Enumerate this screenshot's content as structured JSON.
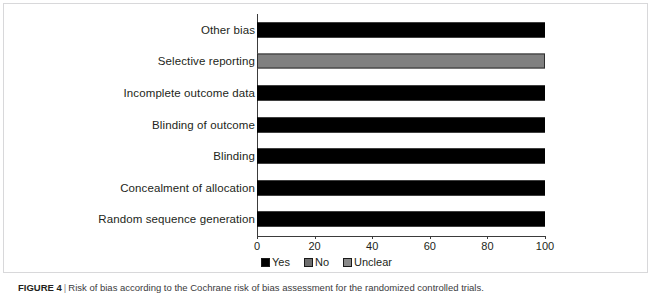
{
  "figure": {
    "caption_label": "FIGURE 4",
    "caption_separator": "|",
    "caption_text": "Risk of bias according to the Cochrane risk of bias assessment for the randomized controlled trials."
  },
  "legend": {
    "items": [
      {
        "label": "Yes",
        "color": "#000000"
      },
      {
        "label": "No",
        "color": "#6e6e6e"
      },
      {
        "label": "Unclear",
        "color": "#8a8a8a"
      }
    ]
  },
  "axis": {
    "x_ticks": [
      "0",
      "20",
      "40",
      "60",
      "80",
      "100"
    ]
  },
  "chart_data": {
    "type": "bar",
    "orientation": "horizontal",
    "stacked": true,
    "title": "",
    "xlabel": "",
    "ylabel": "",
    "xlim": [
      0,
      100
    ],
    "xticks": [
      0,
      20,
      40,
      60,
      80,
      100
    ],
    "grid": false,
    "legend_position": "bottom-center",
    "categories": [
      "Other bias",
      "Selective reporting",
      "Incomplete outcome data",
      "Blinding of outcome",
      "Blinding",
      "Concealment of allocation",
      "Random sequence generation"
    ],
    "series": [
      {
        "name": "Yes",
        "color": "#000000",
        "values": [
          100,
          0,
          100,
          100,
          100,
          100,
          100
        ]
      },
      {
        "name": "No",
        "color": "#6e6e6e",
        "values": [
          0,
          0,
          0,
          0,
          0,
          0,
          0
        ]
      },
      {
        "name": "Unclear",
        "color": "#808080",
        "values": [
          0,
          100,
          0,
          0,
          0,
          0,
          0
        ]
      }
    ],
    "bars": [
      {
        "category": "Other bias",
        "segments": [
          {
            "series": "Yes",
            "value": 100
          }
        ]
      },
      {
        "category": "Selective reporting",
        "segments": [
          {
            "series": "Unclear",
            "value": 100
          }
        ]
      },
      {
        "category": "Incomplete outcome data",
        "segments": [
          {
            "series": "Yes",
            "value": 100
          }
        ]
      },
      {
        "category": "Blinding of outcome",
        "segments": [
          {
            "series": "Yes",
            "value": 100
          }
        ]
      },
      {
        "category": "Blinding",
        "segments": [
          {
            "series": "Yes",
            "value": 100
          }
        ]
      },
      {
        "category": "Concealment of allocation",
        "segments": [
          {
            "series": "Yes",
            "value": 100
          }
        ]
      },
      {
        "category": "Random sequence generation",
        "segments": [
          {
            "series": "Yes",
            "value": 100
          }
        ]
      }
    ]
  }
}
